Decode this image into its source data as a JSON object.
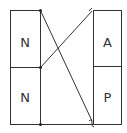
{
  "diagram": {
    "type": "matching",
    "left_column": {
      "cells": [
        {
          "label": "N"
        },
        {
          "label": "N"
        }
      ]
    },
    "right_column": {
      "cells": [
        {
          "label": "A"
        },
        {
          "label": "P"
        }
      ]
    },
    "connections": [
      {
        "from": "left-top-corner",
        "to": "right-bottom-corner"
      },
      {
        "from": "left-middle-corner",
        "to": "right-top-corner"
      },
      {
        "from": "left-bottom-corner",
        "to": "right-bottom-corner"
      }
    ],
    "colors": {
      "stroke": "#333333",
      "background": "#ffffff"
    }
  }
}
